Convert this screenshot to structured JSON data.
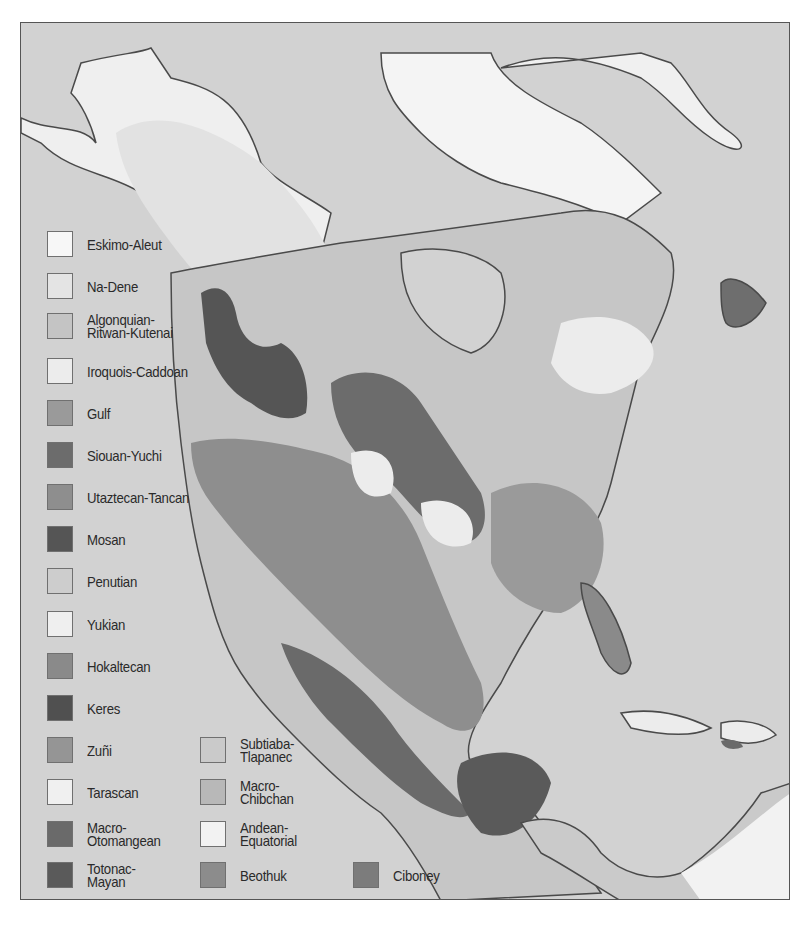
{
  "map": {
    "title": "",
    "legend": [
      {
        "label": "Eskimo-Aleut",
        "color": "#f7f7f7"
      },
      {
        "label": "Na-Dene",
        "color": "#e4e4e4"
      },
      {
        "label": "Algonquian-\nRitwan-Kutenai",
        "color": "#c4c4c4"
      },
      {
        "label": "Iroquois-Caddoan",
        "color": "#ececec"
      },
      {
        "label": "Gulf",
        "color": "#9a9a9a"
      },
      {
        "label": "Siouan-Yuchi",
        "color": "#6c6c6c"
      },
      {
        "label": "Utaztecan-Tancan",
        "color": "#8e8e8e"
      },
      {
        "label": "Mosan",
        "color": "#555555"
      },
      {
        "label": "Penutian",
        "color": "#cdcdcd"
      },
      {
        "label": "Yukian",
        "color": "#efefef"
      },
      {
        "label": "Hokaltecan",
        "color": "#8a8a8a"
      },
      {
        "label": "Keres",
        "color": "#505050"
      },
      {
        "label": "Zuñi",
        "color": "#959595"
      },
      {
        "label": "Tarascan",
        "color": "#f0f0f0"
      },
      {
        "label": "Macro-\nOtomangean",
        "color": "#6a6a6a"
      },
      {
        "label": "Totonac-\nMayan",
        "color": "#5a5a5a"
      },
      {
        "label": "Subtiaba-\nTlapanec",
        "color": "#cacaca"
      },
      {
        "label": "Macro-\nChibchan",
        "color": "#b8b8b8"
      },
      {
        "label": "Andean-\nEquatorial",
        "color": "#f2f2f2"
      },
      {
        "label": "Beothuk",
        "color": "#8c8c8c"
      },
      {
        "label": "Ciboney",
        "color": "#7c7c7c"
      }
    ],
    "colors": {
      "ocean": "#d2d2d2",
      "coastline": "#4a4a4a",
      "frame": "#555555"
    }
  }
}
